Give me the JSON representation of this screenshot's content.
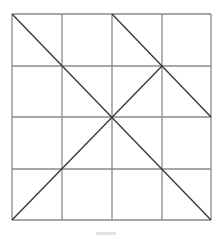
{
  "diagram": {
    "type": "grid-with-diagonals",
    "grid": {
      "rows": 4,
      "cols": 4,
      "x": [
        12,
        62,
        112,
        162,
        211
      ],
      "y": [
        14,
        66,
        117,
        169,
        220
      ],
      "color": "#8a8a8a"
    },
    "diagonals": [
      {
        "name": "main-diagonal",
        "from": [
          12,
          14
        ],
        "to": [
          211,
          220
        ]
      },
      {
        "name": "anti-diagonal-lower",
        "from": [
          12,
          220
        ],
        "to": [
          162,
          66
        ]
      },
      {
        "name": "upper-right-diagonal",
        "from": [
          112,
          14
        ],
        "to": [
          211,
          117
        ]
      }
    ],
    "diagonal_color": "#3a3a3a",
    "background": "#ffffff"
  }
}
